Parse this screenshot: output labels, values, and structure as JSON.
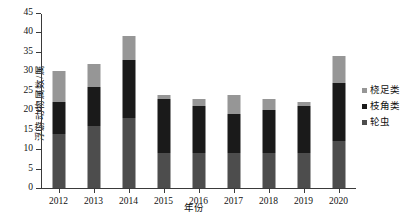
{
  "chart_data": {
    "type": "bar",
    "subtype": "stacked-bar",
    "title": "",
    "xlabel": "年份",
    "ylabel": "浮游动物属数/属",
    "categories": [
      "2012",
      "2013",
      "2014",
      "2015",
      "2016",
      "2017",
      "2018",
      "2019",
      "2020"
    ],
    "ylim": [
      0,
      45
    ],
    "ytick_step": 5,
    "yticks": [
      "0",
      "5",
      "10",
      "15",
      "20",
      "25",
      "30",
      "35",
      "40",
      "45"
    ],
    "grid": false,
    "legend_position": "right",
    "series": [
      {
        "name": "轮虫",
        "color": "#4d4d4d",
        "values": [
          14,
          16,
          18,
          9,
          9,
          9,
          9,
          9,
          12
        ]
      },
      {
        "name": "枝角类",
        "color": "#1a1a1a",
        "values": [
          8,
          10,
          15,
          14,
          12,
          10,
          11,
          12,
          15
        ]
      },
      {
        "name": "桡足类",
        "color": "#969696",
        "values": [
          8,
          6,
          6,
          1,
          2,
          5,
          3,
          1,
          7
        ]
      }
    ],
    "totals": [
      30,
      32,
      39,
      24,
      23,
      24,
      23,
      22,
      34
    ]
  },
  "legend": {
    "items": [
      {
        "label": "桡足类",
        "color": "#969696"
      },
      {
        "label": "枝角类",
        "color": "#1a1a1a"
      },
      {
        "label": "轮虫",
        "color": "#4d4d4d"
      }
    ]
  },
  "axes": {
    "y_title": "浮游动物属数/属",
    "x_title": "年份"
  }
}
